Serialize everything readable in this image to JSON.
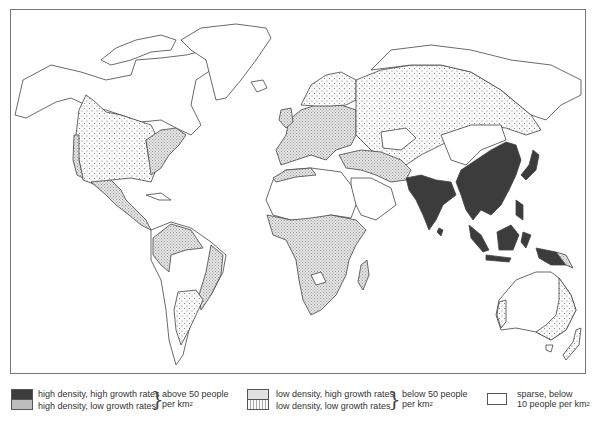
{
  "map": {
    "title": "World population density and growth",
    "colors": {
      "high_density_high_growth": "#3c3c3c",
      "high_density_low_growth": "#bdbdbd",
      "low_density_high_growth": "#dedede",
      "low_density_low_growth_dots": "#888888",
      "sparse": "#ffffff",
      "outline": "#444444"
    },
    "regions": [
      {
        "name": "North America interior",
        "category": "low density, low growth rates"
      },
      {
        "name": "Eastern USA",
        "category": "high density, low growth rates"
      },
      {
        "name": "US West Coast",
        "category": "high density, low growth rates"
      },
      {
        "name": "Mexico & Central America",
        "category": "low density, high growth rates"
      },
      {
        "name": "Northern South America",
        "category": "low density, high growth rates"
      },
      {
        "name": "Eastern Brazil",
        "category": "low density, high growth rates"
      },
      {
        "name": "Argentina",
        "category": "low density, low growth rates"
      },
      {
        "name": "Europe",
        "category": "high density, low growth rates"
      },
      {
        "name": "Russia / USSR",
        "category": "low density, low growth rates"
      },
      {
        "name": "North Africa coast",
        "category": "low density, high growth rates"
      },
      {
        "name": "Sub-Saharan Africa",
        "category": "low density, high growth rates"
      },
      {
        "name": "Middle East",
        "category": "low density, high growth rates"
      },
      {
        "name": "South Asia",
        "category": "high density, high growth rates"
      },
      {
        "name": "East Asia",
        "category": "high density, high growth rates"
      },
      {
        "name": "Japan",
        "category": "high density, high growth rates"
      },
      {
        "name": "Southeast Asia",
        "category": "high density, high growth rates"
      },
      {
        "name": "Eastern Australia",
        "category": "low density, low growth rates"
      },
      {
        "name": "Sahara / Arabia / Siberia / Canada / Greenland",
        "category": "sparse, below 10 people per km2"
      }
    ]
  },
  "legend": {
    "group1": {
      "items": [
        "high density, high growth rates",
        "high density, low growth rates"
      ],
      "range_line1": "above 50 people",
      "range_line2": "per km",
      "range_sup": "2"
    },
    "group2": {
      "items": [
        "low density, high growth rates",
        "low density, low growth rates"
      ],
      "range_line1": "below 50 people",
      "range_line2": "per km",
      "range_sup": "2"
    },
    "group3": {
      "line1": "sparse, below",
      "line2": "10 people per km",
      "sup": "2"
    },
    "brace": "}"
  }
}
